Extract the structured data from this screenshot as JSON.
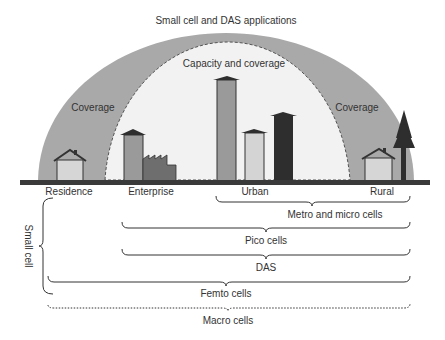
{
  "title": "Small cell and DAS applications",
  "zones": {
    "outer": "Coverage",
    "inner": "Capacity and coverage",
    "right": "Coverage"
  },
  "locations": [
    "Residence",
    "Enterprise",
    "Urban",
    "Rural"
  ],
  "brackets": [
    {
      "label": "Metro and micro cells",
      "span": "Urban to Rural"
    },
    {
      "label": "Pico cells",
      "span": "Enterprise to Rural"
    },
    {
      "label": "DAS",
      "span": "Enterprise to Rural"
    },
    {
      "label": "Femto cells",
      "span": "Residence to Rural"
    },
    {
      "label": "Macro cells",
      "span": "Residence to Rural",
      "style": "dotted"
    }
  ],
  "side_label": "Small cell",
  "colors": {
    "outer_dome": "#a9a9a9",
    "inner_dome": "#f2f2f2",
    "ground": "#3a3a3a",
    "dark": "#2e2e2e"
  }
}
